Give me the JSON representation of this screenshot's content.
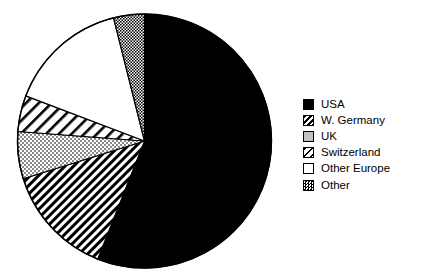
{
  "chart_data": {
    "type": "pie",
    "title": "",
    "subtitle": "",
    "xlabel": "",
    "ylabel": "",
    "legend_position": "right",
    "grid": false,
    "start_angle_deg": 0,
    "direction": "clockwise",
    "categories": [
      "USA",
      "W. Germany",
      "UK",
      "Switzerland",
      "Other Europe",
      "Other"
    ],
    "values": [
      56.0,
      14.2,
      6.0,
      4.6,
      15.3,
      3.9
    ],
    "units": "percent",
    "slices": [
      {
        "label": "USA",
        "value": 56.0,
        "start_deg": 0.0,
        "end_deg": 201.6,
        "fill": "solid-black",
        "color": "#000000"
      },
      {
        "label": "W. Germany",
        "value": 14.2,
        "start_deg": 201.6,
        "end_deg": 252.7,
        "fill": "dense-diagonal-stripes",
        "color": "#000000"
      },
      {
        "label": "UK",
        "value": 6.0,
        "start_deg": 252.7,
        "end_deg": 274.3,
        "fill": "light-checker",
        "color": "#bfbfbf"
      },
      {
        "label": "Switzerland",
        "value": 4.6,
        "start_deg": 274.3,
        "end_deg": 290.8,
        "fill": "wide-diagonal-stripes",
        "color": "#000000"
      },
      {
        "label": "Other Europe",
        "value": 15.3,
        "start_deg": 290.8,
        "end_deg": 345.9,
        "fill": "white",
        "color": "#ffffff"
      },
      {
        "label": "Other",
        "value": 3.9,
        "start_deg": 345.9,
        "end_deg": 360.0,
        "fill": "medium-checker",
        "color": "#737373"
      }
    ],
    "geometry": {
      "center_x": 144.5,
      "center_y": 141.0,
      "radius": 127.0
    }
  },
  "legend": {
    "items": [
      {
        "label": "USA",
        "swatch": "swatch-solid-black"
      },
      {
        "label": "W. Germany",
        "swatch": "swatch-dense-stripes"
      },
      {
        "label": "UK",
        "swatch": "swatch-light-checker"
      },
      {
        "label": "Switzerland",
        "swatch": "swatch-wide-stripes"
      },
      {
        "label": "Other Europe",
        "swatch": "swatch-white"
      },
      {
        "label": "Other",
        "swatch": "swatch-medium-checker"
      }
    ]
  }
}
